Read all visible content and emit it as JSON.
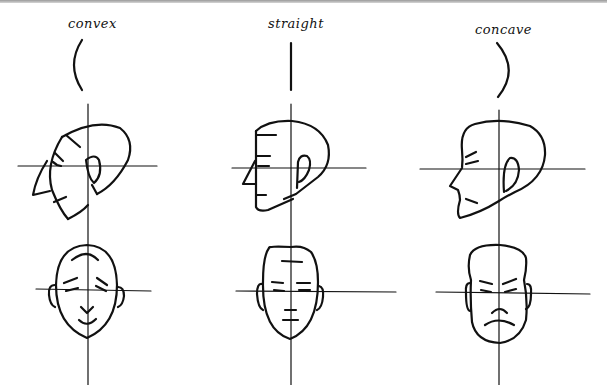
{
  "labels": {
    "convex": "convex",
    "straight": "straight",
    "concave": "concave"
  },
  "colors": {
    "background": "#ffffff",
    "ink": "#111111",
    "top_border": "#9a9a9a"
  }
}
